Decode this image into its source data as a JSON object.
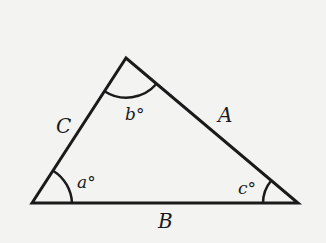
{
  "diagram": {
    "type": "triangle",
    "background": "#f3f3f1",
    "stroke_color": "#1a1a1a",
    "vertices": {
      "left": [
        32,
        203
      ],
      "top": [
        126,
        58
      ],
      "right": [
        298,
        203
      ]
    },
    "sides": [
      {
        "id": "A",
        "label": "A",
        "between": [
          "top",
          "right"
        ]
      },
      {
        "id": "B",
        "label": "B",
        "between": [
          "left",
          "right"
        ]
      },
      {
        "id": "C",
        "label": "C",
        "between": [
          "left",
          "top"
        ]
      }
    ],
    "angles": [
      {
        "id": "a",
        "label": "a°",
        "vertex": "left"
      },
      {
        "id": "b",
        "label": "b°",
        "vertex": "top"
      },
      {
        "id": "c",
        "label": "c°",
        "vertex": "right"
      }
    ]
  },
  "labels": {
    "side_A": "A",
    "side_B": "B",
    "side_C": "C",
    "angle_a": "a°",
    "angle_b": "b°",
    "angle_c": "c°"
  }
}
